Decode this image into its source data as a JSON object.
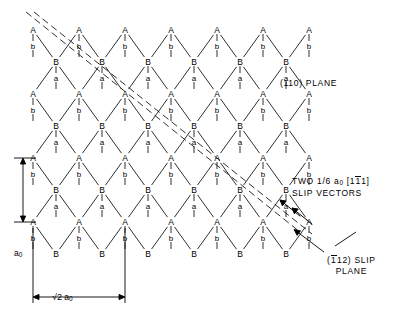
{
  "figure": {
    "type": "crystal-lattice-diagram"
  },
  "annotations": {
    "plane_label": "(110) PLANE",
    "slip_vectors_line1_prefix": "TWO 1/6 a",
    "slip_vectors_sub": "0",
    "slip_vectors_bracket_open": "[",
    "slip_vectors_d1": "1",
    "slip_vectors_d2": "1",
    "slip_vectors_d3": "1",
    "slip_vectors_bracket_close": "]",
    "slip_vectors_line2": "SLIP VECTORS",
    "slip_plane_open": "(",
    "slip_plane_d1": "1",
    "slip_plane_d2": "1",
    "slip_plane_d3": "2",
    "slip_plane_close": ") SLIP",
    "slip_plane_line2": "PLANE"
  },
  "dimensions": {
    "vertical_symbol": "a",
    "vertical_sub": "0",
    "horizontal_radical": "√2",
    "horizontal_symbol": " a",
    "horizontal_sub": "0"
  },
  "lattice": {
    "atom_label_a": "A",
    "atom_label_b": "B",
    "bond_label_a": "a",
    "bond_label_b": "b",
    "origin_x": 33,
    "origin_y": 30,
    "col_spacing": 46,
    "row_spacing": 32,
    "num_a_cols": 7,
    "num_rows": 8,
    "stroke": "#1a1a1a"
  },
  "colors": {
    "ink": "#000000",
    "line": "#1a1a1a",
    "background": "#ffffff"
  }
}
